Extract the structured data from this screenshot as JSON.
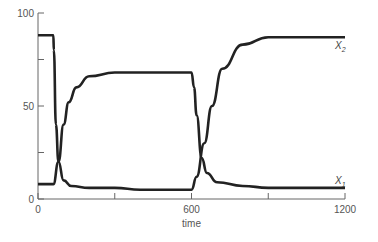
{
  "chart_data": {
    "type": "line",
    "title": "",
    "xlabel": "time",
    "ylabel": "",
    "xlim": [
      0,
      1200
    ],
    "ylim": [
      0,
      100
    ],
    "x_ticks": [
      0,
      300,
      600,
      900,
      1200
    ],
    "x_tick_labels": [
      "0",
      "",
      "600",
      "",
      "1200"
    ],
    "y_ticks": [
      0,
      25,
      50,
      75,
      100
    ],
    "y_tick_labels": [
      "0",
      "",
      "50",
      "",
      "100"
    ],
    "grid": false,
    "legend": "inline labels at right end of curves",
    "series": [
      {
        "name": "X1",
        "label_main": "X",
        "label_sub": "1",
        "x": [
          0,
          60,
          80,
          100,
          120,
          150,
          200,
          300,
          400,
          500,
          600,
          610,
          620,
          640,
          660,
          700,
          800,
          900,
          1000,
          1200
        ],
        "values": [
          8,
          8,
          20,
          40,
          52,
          60,
          66,
          68,
          68,
          68,
          68,
          60,
          45,
          22,
          14,
          9,
          7,
          6,
          6,
          6
        ]
      },
      {
        "name": "X2",
        "label_main": "X",
        "label_sub": "2",
        "x": [
          0,
          60,
          62,
          70,
          80,
          100,
          130,
          200,
          300,
          400,
          500,
          580,
          600,
          620,
          650,
          680,
          720,
          800,
          900,
          1000,
          1200
        ],
        "values": [
          88,
          88,
          80,
          40,
          20,
          10,
          7,
          6,
          6,
          5,
          5,
          5,
          5,
          12,
          30,
          50,
          70,
          83,
          87,
          87,
          87
        ]
      }
    ]
  }
}
